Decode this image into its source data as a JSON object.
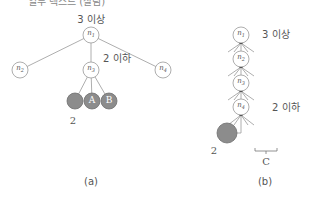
{
  "top_cropped_text": "일부 텍스트 (잘림)",
  "diagram_a": {
    "caption": "(a)",
    "root": {
      "label": "n",
      "sub": "1",
      "annotation": "3 이상"
    },
    "children": [
      {
        "label": "n",
        "sub": "2"
      },
      {
        "label": "n",
        "sub": "3",
        "annotation": "2 이하"
      },
      {
        "label": "n",
        "sub": "4"
      }
    ],
    "leaves": [
      {
        "label": "",
        "color": "#8c8c8c"
      },
      {
        "label": "A",
        "color": "#8c8c8c"
      },
      {
        "label": "B",
        "color": "#8c8c8c"
      }
    ],
    "leaf_count_label": "2"
  },
  "diagram_b": {
    "caption": "(b)",
    "chain": [
      {
        "label": "n",
        "sub": "1",
        "annotation": "3 이상"
      },
      {
        "label": "n",
        "sub": "2"
      },
      {
        "label": "n",
        "sub": "3"
      },
      {
        "label": "n",
        "sub": "4",
        "annotation": "2 이하"
      }
    ],
    "leaf": {
      "color": "#8c8c8c"
    },
    "leaf_count_label": "2",
    "bracket_label": "C"
  },
  "colors": {
    "line": "#888888",
    "node_fill": "#ffffff",
    "leaf_fill": "#8c8c8c",
    "leaf_stroke": "#6e6e6e"
  }
}
